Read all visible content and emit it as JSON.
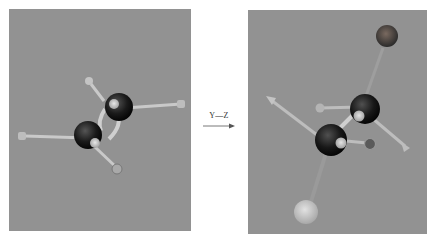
{
  "figure": {
    "left_photo": {
      "description": "Ball-and-stick model of ethane-like molecule, eclipsed view",
      "background": "#929292"
    },
    "transform": {
      "label": "Y—Z",
      "arrow": "right-arrow"
    },
    "right_photo": {
      "description": "Same ball-and-stick molecular model rotated, showing two carbon centers with substituents",
      "background": "#929292"
    }
  }
}
